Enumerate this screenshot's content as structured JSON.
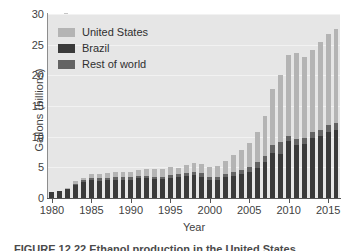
{
  "chart_data": {
    "type": "bar",
    "subtype": "stacked-bar",
    "title": "",
    "xlabel": "Year",
    "ylabel": "Gallons (billions)",
    "ylim": [
      0,
      30
    ],
    "yticks": [
      0,
      5,
      10,
      15,
      20,
      25,
      30
    ],
    "xticks": [
      1980,
      1985,
      1990,
      1995,
      2000,
      2005,
      2010,
      2015
    ],
    "xlim": [
      1979.5,
      2016.5
    ],
    "grid": true,
    "grid_axis": "y",
    "legend_position": "upper-left-inside",
    "plot_background": "#e6e6e6",
    "categories": [
      1980,
      1981,
      1982,
      1983,
      1984,
      1985,
      1986,
      1987,
      1988,
      1989,
      1990,
      1991,
      1992,
      1993,
      1994,
      1995,
      1996,
      1997,
      1998,
      1999,
      2000,
      2001,
      2002,
      2003,
      2004,
      2005,
      2006,
      2007,
      2008,
      2009,
      2010,
      2011,
      2012,
      2013,
      2014,
      2015,
      2016
    ],
    "series": [
      {
        "name": "Brazil",
        "color": "#3a3a3a",
        "stack_order": 0,
        "values": [
          0.9,
          1.1,
          1.4,
          2.1,
          2.6,
          2.9,
          2.8,
          2.9,
          3.0,
          3.0,
          3.0,
          3.2,
          3.2,
          3.1,
          3.1,
          3.3,
          3.4,
          3.6,
          3.8,
          3.5,
          2.9,
          3.0,
          3.4,
          3.6,
          3.9,
          4.3,
          4.9,
          5.9,
          7.4,
          7.1,
          9.3,
          8.7,
          8.8,
          9.8,
          10.1,
          10.8,
          11.1
        ]
      },
      {
        "name": "Rest of world",
        "color": "#636363",
        "stack_order": 1,
        "values": [
          0.0,
          0.0,
          0.1,
          0.2,
          0.3,
          0.4,
          0.4,
          0.4,
          0.4,
          0.4,
          0.4,
          0.4,
          0.4,
          0.4,
          0.4,
          0.4,
          0.5,
          0.5,
          0.5,
          0.5,
          0.5,
          0.5,
          0.5,
          0.6,
          0.6,
          0.7,
          0.9,
          1.0,
          1.2,
          2.1,
          0.8,
          1.0,
          1.0,
          1.0,
          1.0,
          1.1,
          1.2
        ]
      },
      {
        "name": "United States",
        "color": "#b4b4b4",
        "stack_order": 2,
        "values": [
          0.0,
          0.1,
          0.2,
          0.4,
          0.4,
          0.6,
          0.7,
          0.8,
          0.8,
          0.8,
          0.9,
          1.0,
          1.1,
          1.2,
          1.3,
          1.4,
          1.0,
          1.3,
          1.4,
          1.5,
          1.6,
          1.8,
          2.1,
          2.8,
          3.4,
          3.9,
          4.9,
          6.5,
          9.2,
          10.8,
          13.3,
          13.9,
          13.2,
          13.3,
          14.3,
          14.8,
          15.3
        ]
      }
    ],
    "totals": [
      0.9,
      1.2,
      1.7,
      2.7,
      3.3,
      3.9,
      3.9,
      4.1,
      4.2,
      4.2,
      4.3,
      4.6,
      4.7,
      4.7,
      4.8,
      5.1,
      4.9,
      5.4,
      5.7,
      5.5,
      5.0,
      5.3,
      6.0,
      7.0,
      7.9,
      8.9,
      10.7,
      13.4,
      17.8,
      20.0,
      23.4,
      23.6,
      23.0,
      24.1,
      25.4,
      26.7,
      27.6
    ]
  },
  "legend": {
    "items": [
      {
        "label": "United States",
        "color": "#b4b4b4"
      },
      {
        "label": "Brazil",
        "color": "#3a3a3a"
      },
      {
        "label": "Rest of world",
        "color": "#636363"
      }
    ]
  },
  "axes": {
    "y_title": "Gallons (billions)",
    "x_title": "Year",
    "y_tick_labels": [
      "0",
      "5",
      "10",
      "15",
      "20",
      "25",
      "30"
    ],
    "x_tick_labels": [
      "1980",
      "1985",
      "1990",
      "1995",
      "2000",
      "2005",
      "2010",
      "2015"
    ]
  },
  "caption": {
    "text": "FIGURE 12.22 Ethanol production in the United States"
  }
}
